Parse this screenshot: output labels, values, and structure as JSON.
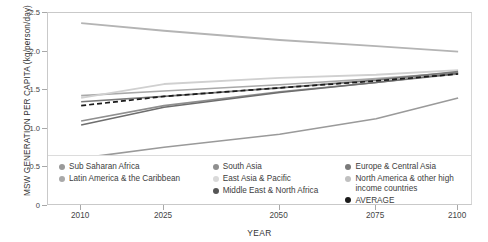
{
  "chart_data": {
    "type": "line",
    "title": "",
    "xlabel": "YEAR",
    "ylabel": "MSW GENERATION PER CAPITA (kg/person/day)",
    "x": [
      2010,
      2025,
      2050,
      2075,
      2100
    ],
    "xticklabels": [
      "2010",
      "2025",
      "2050",
      "2075",
      "2100"
    ],
    "yticklabels": [
      "0",
      "0.5",
      "1.0",
      "1.5",
      "2.0",
      "2.5"
    ],
    "ytickvalues": [
      0,
      0.5,
      1.0,
      1.5,
      2.0,
      2.5
    ],
    "ylim": [
      0,
      2.5
    ],
    "grid": false,
    "legend_position": "bottom-inside",
    "series": [
      {
        "name": "Sub Saharan Africa",
        "color": "#9a9a9a",
        "style": "solid",
        "width": 1.6,
        "values": [
          0.62,
          0.76,
          0.93,
          1.13,
          1.4
        ]
      },
      {
        "name": "Latin America & the Caribbean",
        "color": "#a9a9a9",
        "style": "solid",
        "width": 1.6,
        "values": [
          1.43,
          1.49,
          1.57,
          1.65,
          1.73
        ]
      },
      {
        "name": "South Asia",
        "color": "#8f8f8f",
        "style": "solid",
        "width": 1.6,
        "values": [
          1.1,
          1.3,
          1.48,
          1.6,
          1.71
        ]
      },
      {
        "name": "East Asia & Pacific",
        "color": "#d0d0d0",
        "style": "solid",
        "width": 1.8,
        "values": [
          1.4,
          1.58,
          1.66,
          1.7,
          1.76
        ]
      },
      {
        "name": "Middle East & North Africa",
        "color": "#6e6e6e",
        "style": "solid",
        "width": 1.6,
        "values": [
          1.05,
          1.28,
          1.47,
          1.6,
          1.72
        ]
      },
      {
        "name": "Europe & Central Asia",
        "color": "#7a7a7a",
        "style": "solid",
        "width": 1.6,
        "values": [
          1.35,
          1.42,
          1.53,
          1.63,
          1.74
        ]
      },
      {
        "name": "North America & other high income countries",
        "color": "#b4b4b4",
        "style": "solid",
        "width": 1.8,
        "values": [
          2.37,
          2.27,
          2.15,
          2.07,
          2.0
        ]
      },
      {
        "name": "AVERAGE",
        "color": "#1a1a1a",
        "style": "dashed",
        "width": 1.7,
        "values": [
          1.3,
          1.42,
          1.53,
          1.62,
          1.71
        ]
      }
    ]
  },
  "axes": {
    "ylabel": "MSW GENERATION PER CAPITA (kg/person/day)",
    "xlabel": "YEAR"
  },
  "legend": {
    "columns": [
      {
        "items": [
          {
            "label": "Sub Saharan Africa",
            "color": "#9a9a9a",
            "wrap": false
          },
          {
            "label": "Latin America & the Caribbean",
            "color": "#a9a9a9",
            "wrap": false
          }
        ]
      },
      {
        "items": [
          {
            "label": "South Asia",
            "color": "#8f8f8f",
            "wrap": false
          },
          {
            "label": "East Asia & Pacific",
            "color": "#d9d9d9",
            "wrap": false
          },
          {
            "label": "Middle East & North Africa",
            "color": "#555555",
            "wrap": false
          }
        ]
      },
      {
        "items": [
          {
            "label": "Europe & Central Asia",
            "color": "#7a7a7a",
            "wrap": false
          },
          {
            "label": "North America & other high income countries",
            "color": "#c0c0c0",
            "wrap": true
          },
          {
            "label": "AVERAGE",
            "color": "#1a1a1a",
            "wrap": false
          }
        ]
      }
    ]
  }
}
